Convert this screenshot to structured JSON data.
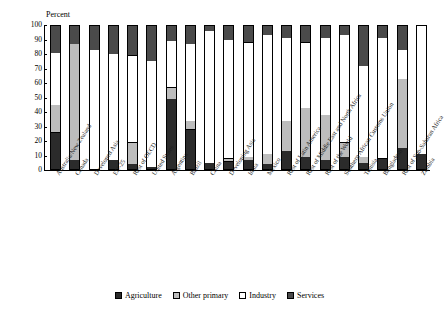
{
  "chart_data": {
    "type": "bar",
    "subtype": "stacked-bar-100-percent",
    "title": "",
    "ylabel": "Percent",
    "xlabel": "",
    "ylim": [
      0,
      100
    ],
    "yticks": [
      0,
      10,
      20,
      30,
      40,
      50,
      60,
      70,
      80,
      90,
      100
    ],
    "grid": false,
    "legend_position": "bottom",
    "legend": [
      "Agriculture",
      "Other primary",
      "Industry",
      "Services"
    ],
    "colors": {
      "agriculture": "#2b2b2b",
      "other_primary": "#bdbdbd",
      "industry": "#ffffff",
      "services": "#4a4a4a"
    },
    "categories": [
      "Australia/New Zealand",
      "Canada",
      "Developed Asia",
      "EU-25",
      "Rest of OECD",
      "United States",
      "Argentina",
      "Brazil",
      "China",
      "Developing Asia",
      "India",
      "Mexico",
      "Rest of Latin America",
      "Rest of Middle East and North Africa",
      "Rest of the World",
      "Southern African Customs Union",
      "Tunisia",
      "Bangladesh",
      "Rest of Sub-Saharan Africa",
      "Zambia"
    ],
    "series": [
      {
        "name": "Agriculture",
        "key": "agriculture",
        "values": [
          26,
          7,
          1,
          7,
          4,
          2,
          49,
          28,
          5,
          6,
          7,
          4,
          13,
          9,
          7,
          9,
          5,
          8,
          15,
          11
        ]
      },
      {
        "name": "Other primary",
        "key": "otherprimary",
        "values": [
          19,
          80,
          0,
          0,
          15,
          0,
          8,
          6,
          0,
          2,
          2,
          7,
          21,
          34,
          31,
          10,
          4,
          0,
          48,
          0
        ]
      },
      {
        "name": "Industry",
        "key": "industry",
        "values": [
          36,
          0,
          82,
          73,
          60,
          73,
          32,
          53,
          91,
          82,
          79,
          82,
          57,
          45,
          53,
          74,
          63,
          83,
          20,
          89
        ]
      },
      {
        "name": "Services",
        "key": "services",
        "values": [
          19,
          13,
          17,
          20,
          21,
          25,
          11,
          13,
          4,
          10,
          12,
          7,
          9,
          12,
          9,
          7,
          28,
          9,
          17,
          0
        ]
      }
    ]
  }
}
